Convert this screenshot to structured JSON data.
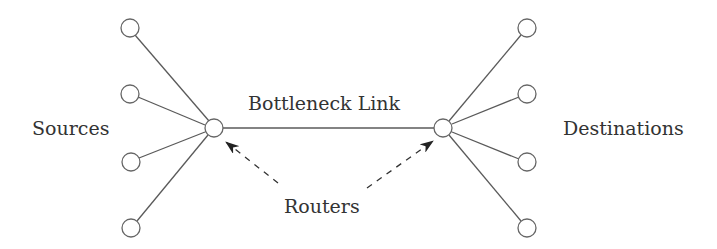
{
  "diagram": {
    "labels": {
      "sources": "Sources",
      "destinations": "Destinations",
      "bottleneck": "Bottleneck Link",
      "routers": "Routers"
    },
    "colors": {
      "line": "#5a5a5a",
      "node_stroke": "#666666",
      "node_fill": "#ffffff",
      "arrow": "#222222",
      "text": "#333333"
    },
    "nodes": {
      "sources": [
        {
          "id": "source-1",
          "x": 130,
          "y": 28
        },
        {
          "id": "source-2",
          "x": 130,
          "y": 94
        },
        {
          "id": "source-3",
          "x": 131,
          "y": 162
        },
        {
          "id": "source-4",
          "x": 131,
          "y": 228
        }
      ],
      "destinations": [
        {
          "id": "destination-1",
          "x": 527,
          "y": 28
        },
        {
          "id": "destination-2",
          "x": 527,
          "y": 94
        },
        {
          "id": "destination-3",
          "x": 527,
          "y": 162
        },
        {
          "id": "destination-4",
          "x": 527,
          "y": 228
        }
      ],
      "routers": [
        {
          "id": "router-left",
          "x": 214,
          "y": 128
        },
        {
          "id": "router-right",
          "x": 443,
          "y": 128
        }
      ]
    },
    "edges": [
      {
        "from": "source-1",
        "to": "router-left"
      },
      {
        "from": "source-2",
        "to": "router-left"
      },
      {
        "from": "source-3",
        "to": "router-left"
      },
      {
        "from": "source-4",
        "to": "router-left"
      },
      {
        "from": "router-left",
        "to": "router-right",
        "label": "Bottleneck Link"
      },
      {
        "from": "router-right",
        "to": "destination-1"
      },
      {
        "from": "router-right",
        "to": "destination-2"
      },
      {
        "from": "router-right",
        "to": "destination-3"
      },
      {
        "from": "router-right",
        "to": "destination-4"
      }
    ],
    "annotations": [
      {
        "label": "Routers",
        "points_to": [
          "router-left",
          "router-right"
        ],
        "style": "dashed-arrow"
      }
    ]
  }
}
